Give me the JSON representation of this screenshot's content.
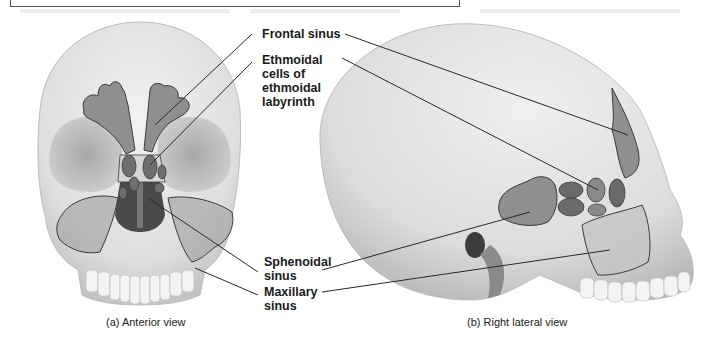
{
  "figure": {
    "labels": {
      "frontal_sinus": "Frontal sinus",
      "ethmoidal_cells": "Ethmoidal\ncells of\nethmoidal\nlabyrinth",
      "sphenoidal_sinus": "Sphenoidal\nsinus",
      "maxillary_sinus": "Maxillary\nsinus"
    },
    "captions": {
      "anterior": "(a) Anterior view",
      "lateral": "(b) Right lateral view"
    },
    "colors": {
      "bone": "#e6e6e6",
      "bone_shadow": "#c8c8c8",
      "sinus_fill": "#8c8c8c",
      "sinus_dark": "#5e5e5e",
      "outline": "#3a3a3a",
      "leader_line": "#2a2a2a"
    }
  }
}
